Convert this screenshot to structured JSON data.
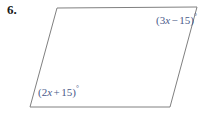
{
  "problem": {
    "number": "6."
  },
  "figure": {
    "shape_name": "parallelogram",
    "stroke_color": "#808080",
    "fill_color": "#ffffff",
    "stroke_width": 1,
    "vertices": [
      {
        "name": "top-left",
        "x": 57,
        "y": 8
      },
      {
        "name": "top-right",
        "x": 197,
        "y": 7
      },
      {
        "name": "bottom-right",
        "x": 170,
        "y": 107
      },
      {
        "name": "bottom-left",
        "x": 30,
        "y": 107
      }
    ]
  },
  "labels": {
    "text_color": "#4a5a8a",
    "top_right": {
      "full_text": "(3x − 15)°",
      "open_paren": "(",
      "coefficient": "3",
      "variable": "x",
      "operator": "−",
      "constant": "15",
      "close_paren": ")",
      "degree": "°"
    },
    "bottom_left": {
      "full_text": "(2x + 15)°",
      "open_paren": "(",
      "coefficient": "2",
      "variable": "x",
      "operator": "+",
      "constant": "15",
      "close_paren": ")",
      "degree": "°"
    }
  }
}
